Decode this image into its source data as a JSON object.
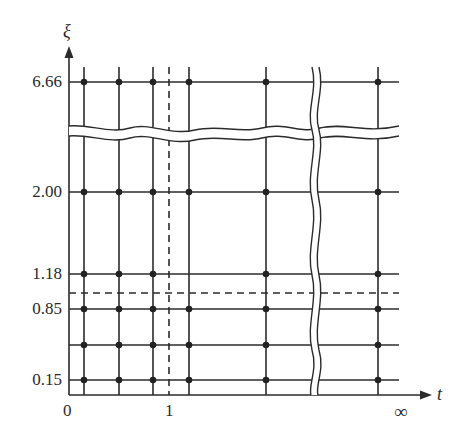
{
  "diagram": {
    "axes": {
      "y_label": "ξ",
      "x_label": "t",
      "x_ticks": [
        {
          "label": "0",
          "x": 68
        },
        {
          "label": "1",
          "x": 169
        },
        {
          "label": "∞",
          "x": 403
        }
      ],
      "y_ticks": [
        {
          "label": "6.66",
          "y": 82
        },
        {
          "label": "2.00",
          "y": 192
        },
        {
          "label": "1.18",
          "y": 274
        },
        {
          "label": "0.85",
          "y": 309
        },
        {
          "label": "0.15",
          "y": 380
        }
      ]
    },
    "grid": {
      "vertical_lines_x": [
        84,
        119,
        153,
        189,
        266,
        378
      ],
      "horizontal_lines_y": [
        82,
        192,
        274,
        309,
        345,
        380
      ],
      "dashed_vertical_x": 169,
      "dashed_horizontal_y": 293,
      "break_horizontal_y": 128,
      "break_vertical_x": 315
    },
    "nodes_note": "Grid points marked at intersections; the point at t-line 4 on the 1.18 row is absent",
    "colors": {
      "line": "#2b2b2b",
      "background": "#ffffff"
    }
  }
}
